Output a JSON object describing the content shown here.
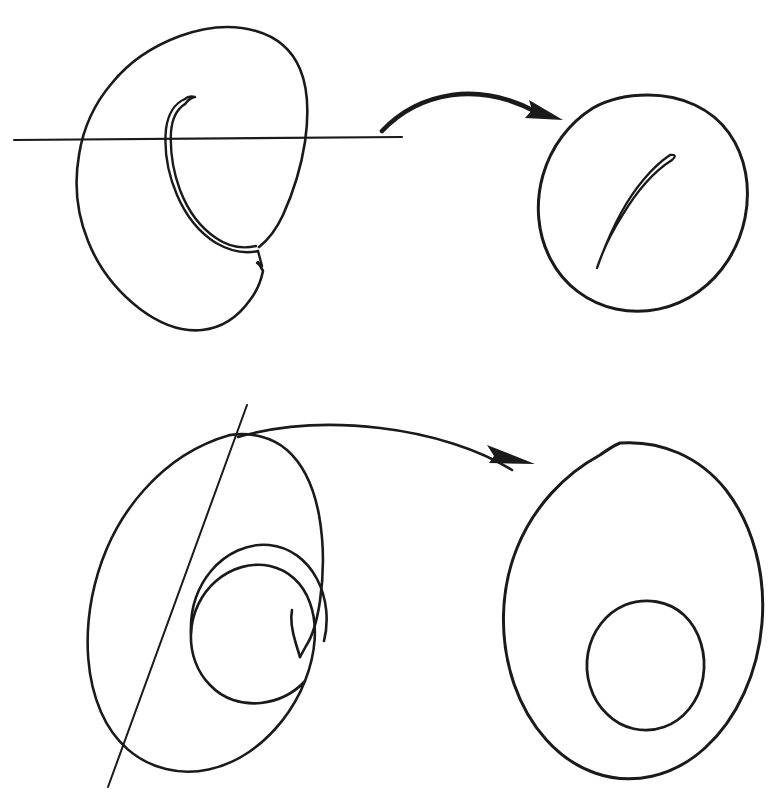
{
  "figure": {
    "background_color": "#ffffff",
    "ink_color": "#1a1a1a",
    "width": 776,
    "height": 809
  },
  "rows": [
    {
      "id": "row-top",
      "label": "top-row",
      "source_shape": {
        "name": "spiral-disc-with-slit",
        "description": "Oval spiral sheet with an inner curled edge and a notch on the right side",
        "stroke_width": 2.6
      },
      "cut_line": {
        "name": "horizontal-cut-line",
        "orientation": "horizontal",
        "x1": 14,
        "y1": 140,
        "x2": 402,
        "y2": 137,
        "stroke_width": 2.2
      },
      "arrow": {
        "name": "transform-arrow-top",
        "style": "thick-curved",
        "start": [
          383,
          131
        ],
        "end": [
          561,
          119
        ],
        "stroke_width": 4.6
      },
      "result_shape": {
        "name": "disc-with-curved-slit",
        "description": "Rounded blob with a thin curved lens-shaped slit inside",
        "stroke_width": 3.0
      }
    },
    {
      "id": "row-bottom",
      "label": "bottom-row",
      "source_shape": {
        "name": "spiral-annulus",
        "description": "Outer oval spiralling inward to an inner circular hook with a V notch",
        "stroke_width": 2.6
      },
      "cut_line": {
        "name": "diagonal-cut-line",
        "orientation": "diagonal",
        "x1": 247,
        "y1": 405,
        "x2": 108,
        "y2": 787,
        "stroke_width": 2.0
      },
      "arrow": {
        "name": "transform-arrow-bottom",
        "style": "thin-curved",
        "start": [
          238,
          436
        ],
        "end": [
          533,
          456
        ],
        "stroke_width": 2.6
      },
      "result_shape": {
        "name": "annulus-ellipse",
        "description": "Large tilted ellipse with a smaller elliptical hole inside",
        "stroke_width": 3.0
      }
    }
  ]
}
